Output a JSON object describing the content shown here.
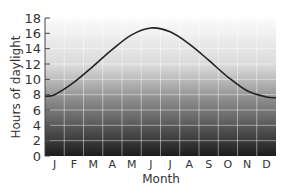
{
  "chart_data": {
    "type": "line",
    "title": "",
    "xlabel": "Month",
    "ylabel": "Hours of daylight",
    "categories": [
      "J",
      "F",
      "M",
      "A",
      "M",
      "J",
      "J",
      "A",
      "S",
      "O",
      "N",
      "D"
    ],
    "yticks": [
      0,
      2,
      4,
      6,
      8,
      10,
      12,
      14,
      16,
      18
    ],
    "ylim": [
      0,
      18
    ],
    "grid": true,
    "series": [
      {
        "name": "Hours of daylight",
        "values": [
          8.0,
          9.6,
          11.7,
          13.9,
          15.8,
          16.7,
          16.2,
          14.6,
          12.5,
          10.3,
          8.5,
          7.7
        ]
      }
    ],
    "start_value": 7.8,
    "end_value": 7.6,
    "line_color": "#222222",
    "background_gradient": [
      "#ffffff",
      "#1a1a1a"
    ]
  }
}
